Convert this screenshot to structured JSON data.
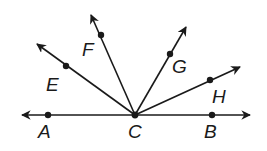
{
  "diagram": {
    "type": "rays-from-point",
    "vertex": {
      "label": "C",
      "x": 135,
      "y": 115
    },
    "line": {
      "label": "AB",
      "through": [
        "A",
        "C",
        "B"
      ]
    },
    "points": [
      {
        "label": "A",
        "x": 48,
        "y": 115,
        "label_x": 38,
        "label_y": 122
      },
      {
        "label": "B",
        "x": 212,
        "y": 115,
        "label_x": 204,
        "label_y": 122
      },
      {
        "label": "C",
        "x": 135,
        "y": 115,
        "label_x": 128,
        "label_y": 122
      },
      {
        "label": "E",
        "x": 66,
        "y": 66,
        "label_x": 46,
        "label_y": 75
      },
      {
        "label": "F",
        "x": 101,
        "y": 35,
        "label_x": 82,
        "label_y": 40
      },
      {
        "label": "G",
        "x": 170,
        "y": 54,
        "label_x": 172,
        "label_y": 57
      },
      {
        "label": "H",
        "x": 210,
        "y": 80,
        "label_x": 212,
        "label_y": 87
      }
    ],
    "rays": [
      "CE",
      "CF",
      "CG",
      "CH",
      "CA",
      "CB"
    ],
    "color": "#1a1a1a"
  }
}
